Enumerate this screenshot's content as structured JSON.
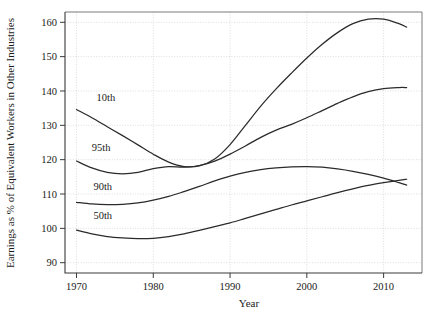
{
  "chart_data": {
    "type": "line",
    "title": "",
    "xlabel": "Year",
    "ylabel": "Earnings as % of Equivalent Workers in Other Industries",
    "xlim": [
      1968.5,
      2015
    ],
    "ylim": [
      87,
      163
    ],
    "xticks": [
      1970,
      1980,
      1990,
      2000,
      2010
    ],
    "xticklabels": [
      "1970",
      "1980",
      "1990",
      "2000",
      "2010"
    ],
    "yticks": [
      90,
      100,
      110,
      120,
      130,
      140,
      150,
      160
    ],
    "yticklabels": [
      "90",
      "100",
      "110",
      "120",
      "130",
      "140",
      "150",
      "160"
    ],
    "grid": true,
    "legend": "inline-labels",
    "line_color": "#2b2b2b",
    "series": [
      {
        "name": "10th",
        "label": "10th",
        "label_x": 1972.6,
        "label_y": 137.0,
        "x": [
          1970,
          1972,
          1974,
          1976,
          1978,
          1980,
          1982,
          1984,
          1986,
          1988,
          1990,
          1992,
          1994,
          1996,
          1998,
          2000,
          2002,
          2004,
          2006,
          2008,
          2010,
          2012,
          2013
        ],
        "values": [
          134.6,
          132.2,
          129.6,
          127.0,
          124.3,
          121.6,
          119.3,
          118.0,
          118.2,
          120.2,
          124.4,
          130.0,
          135.6,
          140.6,
          145.2,
          149.6,
          153.6,
          157.0,
          159.6,
          160.9,
          160.9,
          159.6,
          158.6
        ]
      },
      {
        "name": "95th",
        "label": "95th",
        "label_x": 1972.0,
        "label_y": 122.6,
        "x": [
          1970,
          1972,
          1974,
          1976,
          1978,
          1980,
          1982,
          1984,
          1986,
          1988,
          1990,
          1992,
          1994,
          1996,
          1998,
          2000,
          2002,
          2004,
          2006,
          2008,
          2010,
          2012,
          2013
        ],
        "values": [
          119.6,
          117.6,
          116.3,
          115.9,
          116.3,
          117.4,
          118.0,
          117.8,
          118.3,
          119.6,
          121.6,
          124.0,
          126.5,
          128.6,
          130.3,
          132.2,
          134.3,
          136.4,
          138.3,
          139.8,
          140.7,
          141.0,
          141.0
        ]
      },
      {
        "name": "90th",
        "label": "90th",
        "label_x": 1972.2,
        "label_y": 111.2,
        "x": [
          1970,
          1972,
          1974,
          1976,
          1978,
          1980,
          1982,
          1984,
          1986,
          1988,
          1990,
          1992,
          1994,
          1996,
          1998,
          2000,
          2002,
          2004,
          2006,
          2008,
          2010,
          2012,
          2013
        ],
        "values": [
          107.6,
          107.1,
          106.9,
          107.0,
          107.4,
          108.2,
          109.3,
          110.7,
          112.2,
          113.8,
          115.2,
          116.3,
          117.1,
          117.6,
          117.9,
          118.0,
          117.8,
          117.3,
          116.6,
          115.7,
          114.6,
          113.3,
          112.6
        ]
      },
      {
        "name": "50th",
        "label": "50th",
        "label_x": 1972.2,
        "label_y": 102.6,
        "x": [
          1970,
          1972,
          1974,
          1976,
          1978,
          1980,
          1982,
          1984,
          1986,
          1988,
          1990,
          1992,
          1994,
          1996,
          1998,
          2000,
          2002,
          2004,
          2006,
          2008,
          2010,
          2012,
          2013
        ],
        "values": [
          99.5,
          98.4,
          97.6,
          97.2,
          97.0,
          97.1,
          97.6,
          98.4,
          99.4,
          100.5,
          101.6,
          102.9,
          104.2,
          105.5,
          106.8,
          108.0,
          109.2,
          110.4,
          111.5,
          112.5,
          113.3,
          114.0,
          114.3
        ]
      }
    ]
  }
}
